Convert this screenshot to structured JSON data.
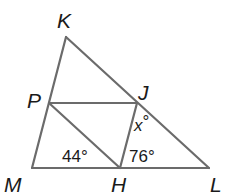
{
  "diagram": {
    "type": "geometry-triangle",
    "vertices": {
      "K": {
        "label": "K",
        "x": 66,
        "y": 37
      },
      "P": {
        "label": "P",
        "x": 49,
        "y": 103
      },
      "J": {
        "label": "J",
        "x": 137,
        "y": 103
      },
      "M": {
        "label": "M",
        "x": 32,
        "y": 168
      },
      "H": {
        "label": "H",
        "x": 120,
        "y": 168
      },
      "L": {
        "label": "L",
        "x": 209,
        "y": 168
      }
    },
    "segments": [
      [
        "K",
        "M"
      ],
      [
        "K",
        "L"
      ],
      [
        "M",
        "L"
      ],
      [
        "P",
        "J"
      ],
      [
        "P",
        "H"
      ],
      [
        "J",
        "H"
      ]
    ],
    "angles": {
      "angle_PHM": "44°",
      "angle_JHL": "76°",
      "angle_HJL": "x°"
    },
    "angle_x_var": "x",
    "angle_x_deg": "°",
    "stroke_color": "#6b6b6b",
    "text_color": "#1a1a1a"
  }
}
